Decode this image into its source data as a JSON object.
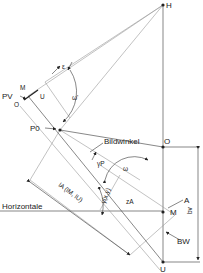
{
  "caption_fragment": "...",
  "labels": {
    "H": "H",
    "PV": "PV",
    "M_small": "M",
    "O_small": "O",
    "U_small": "U",
    "epsilon": "ε",
    "omega_prime": "ω'",
    "P0": "P0",
    "bildwinkel": "Bildwinkel",
    "gamma_p": "γP",
    "omega": "ω",
    "O": "O",
    "A": "A",
    "zA": "zA",
    "M": "M",
    "horizontale": "Horizontale",
    "lA": "lA (lM, lU)",
    "gamma_xy": "γ(x,y)",
    "BW": "BW",
    "bv": "bv",
    "U": "U"
  },
  "colors": {
    "line": "#555555",
    "light_line": "#999999",
    "text": "#222222",
    "background": "#ffffff"
  }
}
